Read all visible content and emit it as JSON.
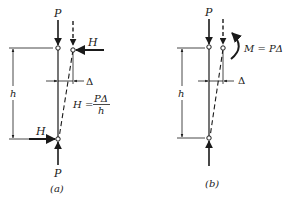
{
  "figure": {
    "type": "structural diagram"
  },
  "panel_a": {
    "caption": "(a)",
    "top_load_label": "P",
    "bottom_load_label": "P",
    "top_horizontal_label": "H",
    "bottom_horizontal_label": "H",
    "height_label": "h",
    "drift_label": "Δ",
    "equation_lhs": "H =",
    "equation_numerator": "PΔ",
    "equation_denominator": "h"
  },
  "panel_b": {
    "caption": "(b)",
    "top_load_label": "P",
    "height_label": "h",
    "drift_label": "Δ",
    "moment_label": "M = PΔ"
  },
  "colors": {
    "ink": "#1a1a1a",
    "background": "#ffffff"
  }
}
